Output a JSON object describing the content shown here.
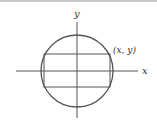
{
  "diagram": {
    "labels": {
      "y_axis": "y",
      "x_axis": "x",
      "point": "(x, y)"
    },
    "colors": {
      "stroke": "#555555",
      "text": "#333333",
      "background": "#ffffff",
      "top_border": "#c8c8c8"
    },
    "shapes": {
      "circle": {
        "cx": 77,
        "cy": 71,
        "r": 36
      },
      "rectangle": {
        "x1": 44,
        "y1": 54,
        "x2": 110,
        "y2": 87
      },
      "x_axis": {
        "x1": 16,
        "x2": 138,
        "y": 71
      },
      "y_axis": {
        "x": 77,
        "y1": 22,
        "y2": 118
      }
    }
  }
}
